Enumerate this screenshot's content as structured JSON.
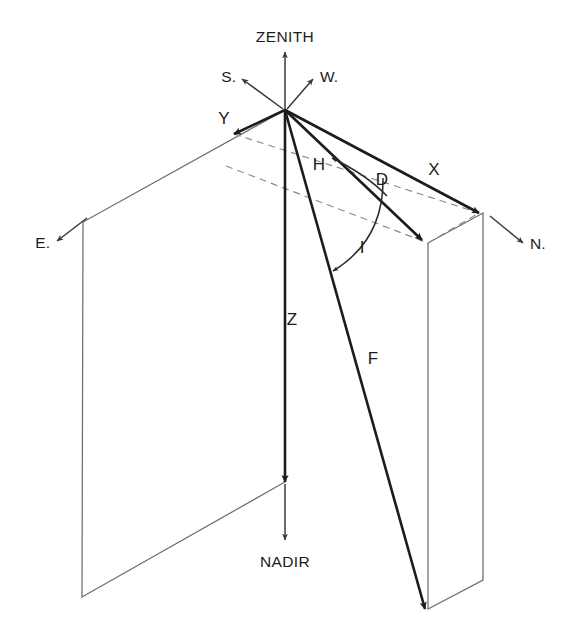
{
  "figure": {
    "type": "technical-line-diagram",
    "background_color": "#ffffff",
    "line_color": "#1c1c1c",
    "thin_line_color": "#6d6d6d",
    "dashed_line_color": "#8a8a8a"
  },
  "labels": {
    "zenith": "ZENITH",
    "nadir": "NADIR",
    "south": "S.",
    "west": "W.",
    "east": "E.",
    "north": "N.",
    "vector_y": "Y",
    "vector_x": "X",
    "vector_h": "H",
    "vector_z": "Z",
    "vector_f": "F",
    "angle_d": "D",
    "angle_i": "I"
  },
  "geometry": {
    "origin": {
      "x": 285,
      "y": 110
    },
    "nadir_point": {
      "x": 285,
      "y": 482
    },
    "y_tip": {
      "x": 234,
      "y": 134
    },
    "x_tip": {
      "x": 479,
      "y": 213
    },
    "h_tip": {
      "x": 422,
      "y": 240
    },
    "f_tip": {
      "x": 425,
      "y": 609
    },
    "left_plane": [
      {
        "x": 285,
        "y": 110
      },
      {
        "x": 83,
        "y": 222
      },
      {
        "x": 82,
        "y": 597
      },
      {
        "x": 285,
        "y": 482
      }
    ],
    "right_plane": [
      {
        "x": 483,
        "y": 213
      },
      {
        "x": 428,
        "y": 243
      },
      {
        "x": 428,
        "y": 609
      },
      {
        "x": 483,
        "y": 580
      }
    ],
    "zenith_arrow_tip": {
      "x": 285,
      "y": 52
    },
    "nadir_arrow_tip": {
      "x": 285,
      "y": 540
    },
    "south_arrow_tip": {
      "x": 242,
      "y": 79
    },
    "west_arrow_tip": {
      "x": 313,
      "y": 79
    },
    "east_arrow_tip": {
      "x": 57,
      "y": 241
    },
    "north_arrow_tip": {
      "x": 523,
      "y": 243
    }
  }
}
